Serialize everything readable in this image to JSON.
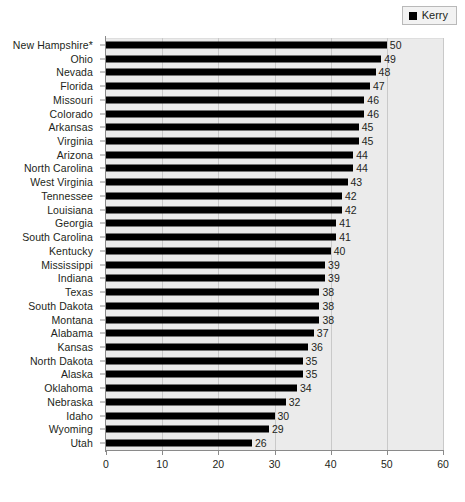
{
  "legend": {
    "entries": [
      {
        "label": "Kerry",
        "color": "#000000",
        "marker": "square"
      }
    ],
    "position": "top-right"
  },
  "axes": {
    "x": {
      "min": 0,
      "max": 60,
      "step": 10,
      "ticks": [
        "0",
        "10",
        "20",
        "30",
        "40",
        "50",
        "60"
      ],
      "label": ""
    },
    "y": {
      "label": ""
    }
  },
  "chart_data": {
    "type": "bar",
    "orientation": "horizontal",
    "title": "",
    "subtitle": "",
    "xlabel": "",
    "ylabel": "",
    "xlim": [
      0,
      60
    ],
    "grid": true,
    "legend_position": "top-right",
    "series": [
      {
        "name": "Kerry",
        "color": "#000000",
        "values": [
          50,
          49,
          48,
          47,
          46,
          46,
          45,
          45,
          44,
          44,
          43,
          42,
          42,
          41,
          41,
          40,
          39,
          39,
          38,
          38,
          38,
          37,
          36,
          35,
          35,
          34,
          32,
          30,
          29,
          26
        ]
      }
    ],
    "categories": [
      "New Hampshire*",
      "Ohio",
      "Nevada",
      "Florida",
      "Missouri",
      "Colorado",
      "Arkansas",
      "Virginia",
      "Arizona",
      "North Carolina",
      "West Virginia",
      "Tennessee",
      "Louisiana",
      "Georgia",
      "South Carolina",
      "Kentucky",
      "Mississippi",
      "Indiana",
      "Texas",
      "South Dakota",
      "Montana",
      "Alabama",
      "Kansas",
      "North Dakota",
      "Alaska",
      "Oklahoma",
      "Nebraska",
      "Idaho",
      "Wyoming",
      "Utah"
    ],
    "data_labels": [
      "50",
      "49",
      "48",
      "47",
      "46",
      "46",
      "45",
      "45",
      "44",
      "44",
      "43",
      "42",
      "42",
      "41",
      "41",
      "40",
      "39",
      "39",
      "38",
      "38",
      "38",
      "37",
      "36",
      "35",
      "35",
      "34",
      "32",
      "30",
      "29",
      "26"
    ]
  }
}
